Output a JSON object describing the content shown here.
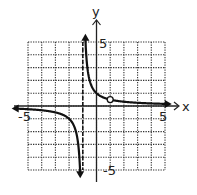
{
  "chart_data": {
    "type": "line",
    "title": "",
    "xlabel": "x",
    "ylabel": "y",
    "xlim": [
      -5,
      5
    ],
    "ylim": [
      -5,
      5
    ],
    "grid": true,
    "grid_step": 1,
    "tick_labels": {
      "x_min": "-5",
      "x_max": "5",
      "y_min": "-5",
      "y_max": "5"
    },
    "function": "y = 1/(x+1)",
    "vertical_asymptote": {
      "x": -1,
      "style": "dashed"
    },
    "horizontal_asymptote": {
      "y": 0
    },
    "hole": {
      "x": 1,
      "y": 0.5
    },
    "series": [
      {
        "name": "left-branch",
        "x": [
          -5,
          -4,
          -3,
          -2,
          -1.5,
          -1.2
        ],
        "y": [
          -0.25,
          -0.333,
          -0.5,
          -1,
          -2,
          -5
        ]
      },
      {
        "name": "right-branch",
        "x": [
          -0.8,
          -0.5,
          0,
          1,
          2,
          3,
          5
        ],
        "y": [
          5,
          2,
          1,
          0.5,
          0.333,
          0.25,
          0.167
        ]
      }
    ]
  },
  "colors": {
    "curve": "#111111",
    "grid": "#333333",
    "axis": "#222222",
    "background": "#ffffff"
  }
}
